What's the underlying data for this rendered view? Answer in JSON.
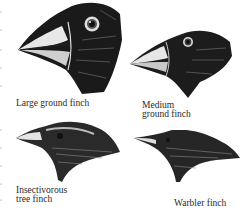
{
  "figure": {
    "title": "",
    "finches": [
      {
        "id": "large-ground-finch",
        "label_lines": [
          "Large ground finch"
        ]
      },
      {
        "id": "medium-ground-finch",
        "label_lines": [
          "Medium",
          "ground finch"
        ]
      },
      {
        "id": "insectivorous-tree-finch",
        "label_lines": [
          "Insectivorous",
          "tree finch"
        ]
      },
      {
        "id": "warbler-finch",
        "label_lines": [
          "Warbler finch"
        ]
      }
    ]
  }
}
